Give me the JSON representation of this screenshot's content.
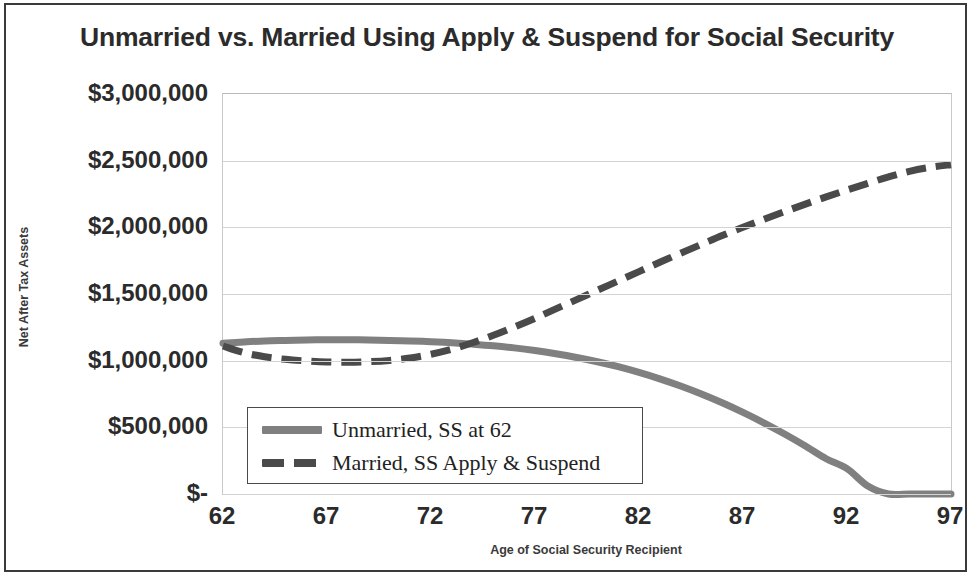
{
  "chart_data": {
    "type": "line",
    "title": "Unmarried vs. Married Using Apply & Suspend for Social Security",
    "xlabel": "Age of Social Security Recipient",
    "ylabel": "Net After Tax Assets",
    "xlim": [
      62,
      97
    ],
    "ylim": [
      0,
      3000000
    ],
    "grid": true,
    "legend_position": "inside-bottom-left",
    "x_tick_labels": [
      "62",
      "67",
      "72",
      "77",
      "82",
      "87",
      "92",
      "97"
    ],
    "x_ticks": [
      62,
      67,
      72,
      77,
      82,
      87,
      92,
      97
    ],
    "y_tick_labels": [
      "$3,000,000",
      "$2,500,000",
      "$2,000,000",
      "$1,500,000",
      "$1,000,000",
      "$500,000",
      "$-"
    ],
    "y_ticks": [
      3000000,
      2500000,
      2000000,
      1500000,
      1000000,
      500000,
      0
    ],
    "x": [
      62,
      63,
      64,
      65,
      66,
      67,
      68,
      69,
      70,
      71,
      72,
      73,
      74,
      75,
      76,
      77,
      78,
      79,
      80,
      81,
      82,
      83,
      84,
      85,
      86,
      87,
      88,
      89,
      90,
      91,
      92,
      93,
      94,
      95,
      96,
      97
    ],
    "series": [
      {
        "name": "Unmarried, SS at 62",
        "style": "solid",
        "color": "#808080",
        "values": [
          1130000,
          1140000,
          1148000,
          1152000,
          1155000,
          1157000,
          1157000,
          1155000,
          1152000,
          1148000,
          1142000,
          1134000,
          1124000,
          1112000,
          1096000,
          1076000,
          1052000,
          1024000,
          992000,
          955000,
          912000,
          864000,
          810000,
          750000,
          684000,
          612000,
          534000,
          450000,
          360000,
          264000,
          190000,
          60000,
          0,
          0,
          0,
          0
        ]
      },
      {
        "name": "Married, SS Apply & Suspend",
        "style": "dashed",
        "color": "#4a4a4a",
        "values": [
          1110000,
          1060000,
          1030000,
          1010000,
          998000,
          990000,
          988000,
          992000,
          1002000,
          1020000,
          1048000,
          1086000,
          1134000,
          1190000,
          1252000,
          1318000,
          1388000,
          1458000,
          1528000,
          1598000,
          1668000,
          1738000,
          1806000,
          1872000,
          1938000,
          2000000,
          2060000,
          2118000,
          2174000,
          2228000,
          2280000,
          2330000,
          2378000,
          2420000,
          2450000,
          2470000
        ]
      }
    ],
    "legend_entries": [
      {
        "label": "Unmarried, SS at 62",
        "style": "solid"
      },
      {
        "label": "Married, SS Apply & Suspend",
        "style": "dashed"
      }
    ]
  }
}
